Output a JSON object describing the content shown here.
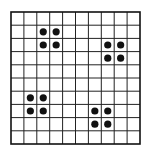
{
  "diagram": {
    "type": "dot-grid",
    "grid": {
      "rows": 10,
      "cols": 10,
      "origin_x": 11,
      "origin_y": 12,
      "cell_w": 12.9,
      "cell_h": 13.2,
      "line_color": "#222222",
      "border_color": "#111111",
      "line_width": 1,
      "border_width": 1.6
    },
    "dot": {
      "radius": 3.6,
      "color": "#111111"
    },
    "clusters": [
      {
        "name": "top-left",
        "cells": [
          [
            1,
            2
          ],
          [
            1,
            3
          ],
          [
            2,
            2
          ],
          [
            2,
            3
          ]
        ]
      },
      {
        "name": "top-right",
        "cells": [
          [
            2,
            7
          ],
          [
            2,
            8
          ],
          [
            3,
            7
          ],
          [
            3,
            8
          ]
        ]
      },
      {
        "name": "bottom-left",
        "cells": [
          [
            6,
            1
          ],
          [
            6,
            2
          ],
          [
            7,
            1
          ],
          [
            7,
            2
          ]
        ]
      },
      {
        "name": "bottom-right",
        "cells": [
          [
            7,
            6
          ],
          [
            7,
            7
          ],
          [
            8,
            6
          ],
          [
            8,
            7
          ]
        ]
      }
    ]
  }
}
